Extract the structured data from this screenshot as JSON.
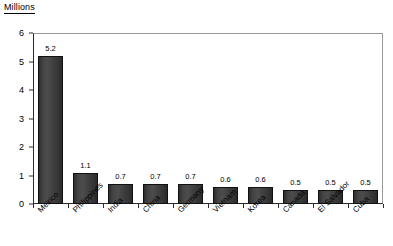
{
  "chart_data": {
    "type": "bar",
    "title": "Millions",
    "xlabel": "",
    "ylabel": "",
    "ylim": [
      0,
      6
    ],
    "yticks": [
      0,
      1,
      2,
      3,
      4,
      5,
      6
    ],
    "ytick_labels": [
      "0",
      "1",
      "2",
      "3",
      "4",
      "5",
      "6"
    ],
    "grid": false,
    "legend": "none",
    "bar_color": "#3c3c3c",
    "categories": [
      "Mexico",
      "Philippines",
      "India",
      "China",
      "Germany",
      "Vietnam",
      "Korea",
      "Canada",
      "El Salvador",
      "Cuba"
    ],
    "values": [
      5.2,
      1.1,
      0.7,
      0.7,
      0.7,
      0.6,
      0.6,
      0.5,
      0.5,
      0.5
    ],
    "data_labels": [
      "5.2",
      "1.1",
      "0.7",
      "0.7",
      "0.7",
      "0.6",
      "0.6",
      "0.5",
      "0.5",
      "0.5"
    ]
  }
}
